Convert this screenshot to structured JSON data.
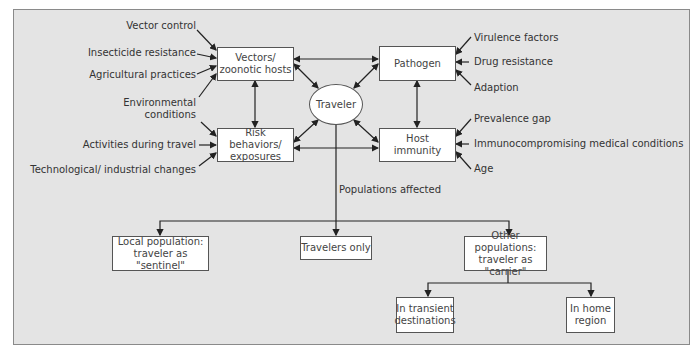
{
  "colors": {
    "frame_bg": "#e4e4e4",
    "box_bg": "#ffffff",
    "stroke": "#222222",
    "text": "#444444"
  },
  "nodes": {
    "vectors": "Vectors/\nzoonotic hosts",
    "risk": "Risk behaviors/\nexposures",
    "pathogen": "Pathogen",
    "host": "Host\nimmunity",
    "traveler": "Traveler",
    "local": "Local population:\ntraveler as \"sentinel\"",
    "travelers_only": "Travelers only",
    "other": "Other populations:\ntraveler as \"carrier\"",
    "transient": "In transient\ndestinations",
    "home": "In home\nregion"
  },
  "left_factors": {
    "vector_control": "Vector control",
    "insecticide": "Insecticide resistance",
    "agricultural": "Agricultural practices",
    "environmental": "Environmental\nconditions",
    "activities": "Activities during travel",
    "technological": "Technological/ industrial changes"
  },
  "right_factors": {
    "virulence": "Virulence factors",
    "drug": "Drug resistance",
    "adaption": "Adaption",
    "prevalence": "Prevalence gap",
    "immuno": "Immunocompromising medical conditions",
    "age": "Age"
  },
  "edge_labels": {
    "populations": "Populations affected"
  }
}
